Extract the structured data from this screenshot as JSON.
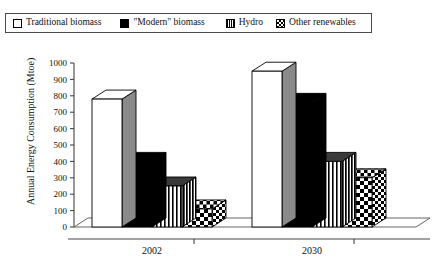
{
  "legend": {
    "position": "top",
    "entries": [
      {
        "label": "Traditional biomass",
        "swatch": "white-square-icon",
        "fill": "#ffffff"
      },
      {
        "label": "\"Modern\" biomass",
        "swatch": "black-square-icon",
        "fill": "#000000"
      },
      {
        "label": "Hydro",
        "swatch": "vertical-stripe-square-icon",
        "fill": "#ffffff"
      },
      {
        "label": "Other renewables",
        "swatch": "checkerboard-square-icon",
        "fill": "#000000"
      }
    ]
  },
  "chart_data": {
    "type": "bar",
    "title": "",
    "xlabel": "",
    "ylabel": "Annual Energy Consumption (Mtoe)",
    "categories": [
      "2002",
      "2030"
    ],
    "ylim": [
      0,
      1000
    ],
    "yticks": [
      0,
      100,
      200,
      300,
      400,
      500,
      600,
      700,
      800,
      900,
      1000
    ],
    "ytick_labels": [
      "0",
      "100",
      "200",
      "300",
      "400",
      "500",
      "600",
      "700",
      "800",
      "900",
      "1000"
    ],
    "grid": false,
    "style": "3d-bars",
    "legend_position": "top",
    "series": [
      {
        "name": "Traditional biomass",
        "values": [
          780,
          950
        ],
        "pattern": "solid-white",
        "fill": "#ffffff"
      },
      {
        "name": "\"Modern\" biomass",
        "values": [
          400,
          760
        ],
        "pattern": "solid-black",
        "fill": "#000000"
      },
      {
        "name": "Hydro",
        "values": [
          250,
          400
        ],
        "pattern": "vertical-stripes",
        "fill": "#ffffff"
      },
      {
        "name": "Other renewables",
        "values": [
          110,
          300
        ],
        "pattern": "checkerboard",
        "fill": "#000000"
      }
    ]
  }
}
